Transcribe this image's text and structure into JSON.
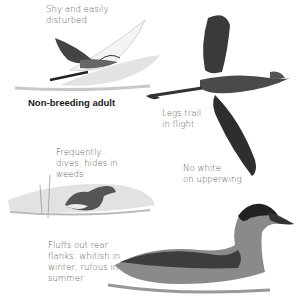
{
  "page": {
    "heading": "Non-breeding adult",
    "captions": {
      "shy": [
        "Shy and easily",
        "disturbed"
      ],
      "legs": [
        "Legs trail",
        "in flight"
      ],
      "upperwing": [
        "No white",
        "on upperwing"
      ],
      "dives": [
        "Frequently",
        "dives, hides in",
        "weeds"
      ],
      "fluffs": [
        "Fluffs out rear",
        "flanks: whitish in",
        "winter, rufous in",
        "summer"
      ]
    },
    "illustrations": [
      {
        "name": "bird-flying-pale-icon",
        "description": "grebe in flight, pale underwing"
      },
      {
        "name": "bird-flying-dark-icon",
        "description": "grebe in flight, dark upperwing"
      },
      {
        "name": "bird-in-weeds-icon",
        "description": "grebe swimming among reeds"
      },
      {
        "name": "bird-swimming-icon",
        "description": "non-breeding adult swimming"
      }
    ]
  }
}
